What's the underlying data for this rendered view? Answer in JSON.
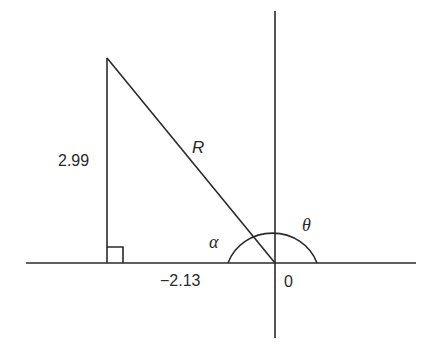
{
  "diagram": {
    "type": "vector-triangle-on-axes",
    "labels": {
      "vertical_side": "2.99",
      "hypotenuse": "R",
      "horizontal_value": "−2.13",
      "origin": "0",
      "inner_angle": "α",
      "polar_angle": "θ"
    },
    "colors": {
      "stroke": "#2a2a2a",
      "background": "#ffffff"
    }
  }
}
